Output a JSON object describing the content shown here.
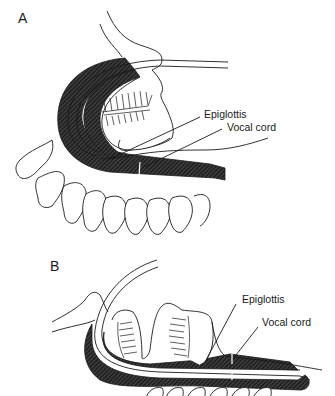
{
  "figure": {
    "panels": [
      {
        "letter": "A",
        "labels": {
          "epiglottis": "Epiglottis",
          "vocal_cord": "Vocal cord"
        }
      },
      {
        "letter": "B",
        "labels": {
          "epiglottis": "Epiglottis",
          "vocal_cord": "Vocal cord"
        }
      }
    ]
  },
  "colors": {
    "ink": "#1a1a1a",
    "hatch": "#2b2b2b",
    "background": "#ffffff"
  }
}
